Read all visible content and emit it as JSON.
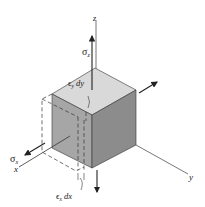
{
  "diagram": {
    "axes": {
      "x_label": "x",
      "y_label": "y",
      "z_label": "z"
    },
    "stresses": {
      "sigma_x": "σ",
      "sigma_x_sub": "x",
      "sigma_z": "σ",
      "sigma_z_sub": "z"
    },
    "strains": {
      "eps_y_dy": "ϵ",
      "eps_y_sub": "y",
      "eps_y_tail": " dy",
      "eps_x_dx": "ϵ",
      "eps_x_sub": "x",
      "eps_x_tail": " dx"
    },
    "colors": {
      "top_face": "#d9d9d9",
      "left_face": "#a6a6a6",
      "right_face": "#8c8c8c",
      "lines": "#333333"
    }
  }
}
